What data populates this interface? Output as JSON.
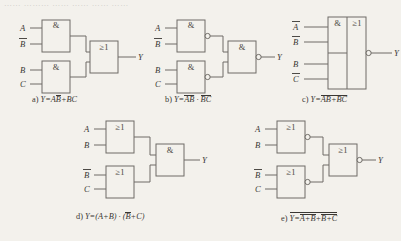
{
  "figure": {
    "background_color": "#f3f1ec",
    "line_color": "#6e6b66",
    "text_color": "#3a3733",
    "top_bleed_text": "…… ……… ……  …… ……   ……",
    "gate_symbols": {
      "and": "&",
      "or": "≥1"
    },
    "output_label": "Y"
  },
  "circuits": [
    {
      "id": "a",
      "caption_prefix": "a)",
      "caption_lhs": "Y=",
      "caption_terms": [
        {
          "text": "A",
          "bar": false
        },
        {
          "text": "B",
          "bar": true
        },
        {
          "text": "+BC",
          "bar": false
        }
      ],
      "caption_plain": "a) Y=AB̅+BC",
      "gates": [
        {
          "name": "and-gate-1",
          "symbol": "&",
          "inverted": false
        },
        {
          "name": "and-gate-2",
          "symbol": "&",
          "inverted": false
        },
        {
          "name": "or-gate-output",
          "symbol": "≥1",
          "inverted": false
        }
      ],
      "inputs": [
        {
          "label": "A",
          "bar": false
        },
        {
          "label": "B",
          "bar": true
        },
        {
          "label": "B",
          "bar": false
        },
        {
          "label": "C",
          "bar": false
        }
      ],
      "output": "Y"
    },
    {
      "id": "b",
      "caption_prefix": "b)",
      "caption_lhs": "Y=",
      "caption_terms": [
        {
          "text": "AB̅",
          "bar": true
        },
        {
          "text": " · ",
          "bar": false
        },
        {
          "text": "BC",
          "bar": true
        }
      ],
      "caption_plain": "b) Y=AB̅̅ · BC̅",
      "gates": [
        {
          "name": "nand-gate-1",
          "symbol": "&",
          "inverted": true
        },
        {
          "name": "nand-gate-2",
          "symbol": "&",
          "inverted": true
        },
        {
          "name": "nand-gate-output",
          "symbol": "&",
          "inverted": true
        }
      ],
      "inputs": [
        {
          "label": "A",
          "bar": false
        },
        {
          "label": "B",
          "bar": true
        },
        {
          "label": "B",
          "bar": false
        },
        {
          "label": "C",
          "bar": false
        }
      ],
      "output": "Y"
    },
    {
      "id": "c",
      "caption_prefix": "c)",
      "caption_lhs": "Y=",
      "caption_terms": [
        {
          "text": "A̅B̅+BC̅",
          "bar": true
        }
      ],
      "caption_plain": "c) Y=A̅B̅+BC̅ (whole expression barred)",
      "gates": [
        {
          "name": "and-section-1",
          "symbol": "&",
          "inverted": false
        },
        {
          "name": "and-section-2",
          "symbol": "&",
          "inverted": false
        },
        {
          "name": "or-section-output",
          "symbol": "≥1",
          "inverted": true
        }
      ],
      "inputs": [
        {
          "label": "A",
          "bar": true
        },
        {
          "label": "B",
          "bar": true
        },
        {
          "label": "B",
          "bar": false
        },
        {
          "label": "C",
          "bar": true
        }
      ],
      "output": "Y"
    },
    {
      "id": "d",
      "caption_prefix": "d)",
      "caption_lhs": "Y=(A+B) · (",
      "caption_terms": [
        {
          "text": "B",
          "bar": true
        },
        {
          "text": "+C)",
          "bar": false
        }
      ],
      "caption_plain": "d) Y=(A+B) · (B̅+C)",
      "gates": [
        {
          "name": "or-gate-1",
          "symbol": "≥1",
          "inverted": false
        },
        {
          "name": "or-gate-2",
          "symbol": "≥1",
          "inverted": false
        },
        {
          "name": "and-gate-output",
          "symbol": "&",
          "inverted": false
        }
      ],
      "inputs": [
        {
          "label": "A",
          "bar": false
        },
        {
          "label": "B",
          "bar": false
        },
        {
          "label": "B",
          "bar": true
        },
        {
          "label": "C",
          "bar": false
        }
      ],
      "output": "Y"
    },
    {
      "id": "e",
      "caption_prefix": "e)",
      "caption_lhs": "Y=",
      "caption_terms": [
        {
          "text": "A+B",
          "bar": true
        },
        {
          "text": "+",
          "bar": false
        },
        {
          "text": "B̅+C",
          "bar": true
        }
      ],
      "caption_plain": "e) Y=A+B̅+B̅+C̅ (outer bar over all)",
      "gates": [
        {
          "name": "nor-gate-1",
          "symbol": "≥1",
          "inverted": true
        },
        {
          "name": "nor-gate-2",
          "symbol": "≥1",
          "inverted": true
        },
        {
          "name": "nor-gate-output",
          "symbol": "≥1",
          "inverted": true
        }
      ],
      "inputs": [
        {
          "label": "A",
          "bar": false
        },
        {
          "label": "B",
          "bar": false
        },
        {
          "label": "B",
          "bar": true
        },
        {
          "label": "C",
          "bar": false
        }
      ],
      "output": "Y"
    }
  ]
}
